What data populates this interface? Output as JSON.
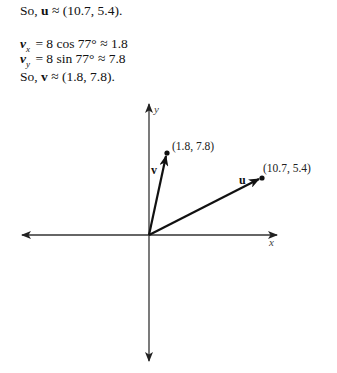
{
  "text": {
    "line1": {
      "prefix": "So, ",
      "vec": "u",
      "rest": " ≈ (10.7, 5.4)."
    },
    "line2": {
      "vec": "v",
      "sub": "x",
      "rest": " = 8 cos 77° ≈ 1.8"
    },
    "line3": {
      "vec": "v",
      "sub": "y",
      "rest": " = 8 sin 77° ≈ 7.8"
    },
    "line4": {
      "prefix": "So, ",
      "vec": "v",
      "rest": " ≈ (1.8, 7.8)."
    }
  },
  "graph": {
    "x_axis_label": "x",
    "y_axis_label": "y",
    "vectors": [
      {
        "name": "u",
        "label": "u",
        "point_label": "(10.7, 5.4)",
        "x": 10.7,
        "y": 5.4
      },
      {
        "name": "v",
        "label": "v",
        "point_label": "(1.8, 7.8)",
        "x": 1.8,
        "y": 7.8
      }
    ],
    "colors": {
      "ink": "#111111",
      "axis": "#333333"
    }
  }
}
